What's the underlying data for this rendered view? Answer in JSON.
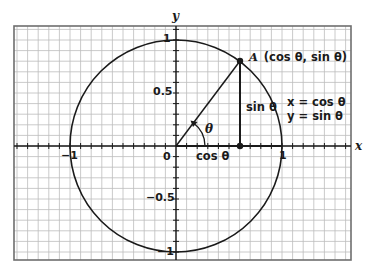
{
  "diagram": {
    "type": "unit-circle",
    "grid": {
      "divisions_per_unit": 10,
      "x_range": [
        -1.5,
        1.65
      ],
      "y_range": [
        -1.07,
        1.13
      ]
    },
    "axes": {
      "x_label": "x",
      "y_label": "y"
    },
    "tick_labels": {
      "y_top": "1",
      "y_half": "0.5",
      "origin": "0",
      "y_neg_half": "−0.5",
      "y_bottom": "−1",
      "x_left": "−1",
      "x_right": "1"
    },
    "point": {
      "name": "A",
      "coords_label": "(cos θ, sin θ)",
      "x": 0.6,
      "y": 0.8
    },
    "angle_label": "θ",
    "segment_labels": {
      "horizontal": "cos θ",
      "vertical": "sin θ"
    },
    "equations": [
      "x = cos θ",
      "y = sin θ"
    ],
    "colors": {
      "grid": "#b8b8b8",
      "border": "#6e6e6e",
      "ink": "#1a1a1a"
    }
  }
}
